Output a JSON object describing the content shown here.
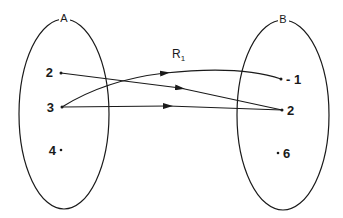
{
  "diagram": {
    "relation_label": "R",
    "relation_subscript": "1",
    "sets": [
      {
        "name": "A",
        "elements": [
          "2",
          "3",
          "4"
        ]
      },
      {
        "name": "B",
        "elements": [
          "- 1",
          "2",
          "6"
        ]
      }
    ],
    "mappings": [
      {
        "from": "2",
        "to": "2"
      },
      {
        "from": "3",
        "to": "- 1"
      },
      {
        "from": "3",
        "to": "2"
      }
    ],
    "colors": {
      "stroke": "#1a1a1a",
      "background": "#ffffff"
    }
  }
}
